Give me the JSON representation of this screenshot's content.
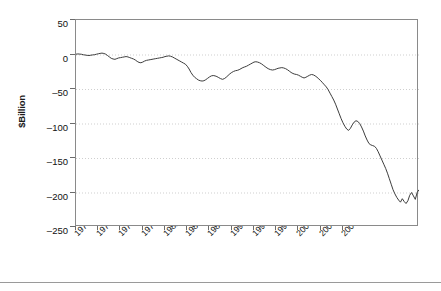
{
  "chart_data": {
    "type": "line",
    "title": "",
    "xlabel": "",
    "ylabel": "$Billion",
    "ylim": [
      -250,
      50
    ],
    "yticks": [
      50,
      0,
      -50,
      -100,
      -150,
      -200,
      -250
    ],
    "xticks": [
      "1970-Q1",
      "1973-Q1",
      "1976-Q1",
      "1979-Q1",
      "1982-Q1",
      "1985-Q1",
      "1988-Q1",
      "1991-Q1",
      "1994-Q1",
      "1997-Q1",
      "2000-Q1",
      "2003-Q1",
      "2006-Q1"
    ],
    "grid": "horizontal-dotted",
    "legend": "none",
    "series": [
      {
        "name": "Balance",
        "color": "#3d3d3d",
        "x_start": "1970-Q1",
        "x_end": "2007-Q3",
        "frequency": "quarterly",
        "values": [
          0.5,
          0.8,
          0.6,
          0.3,
          -0.4,
          -0.8,
          -1.2,
          -1.5,
          -1.0,
          -0.6,
          -0.3,
          0.4,
          1.0,
          1.6,
          2.0,
          1.5,
          0.5,
          -1.5,
          -3.5,
          -5.5,
          -6.5,
          -7.0,
          -6.0,
          -5.0,
          -4.5,
          -4.0,
          -3.5,
          -3.0,
          -3.5,
          -4.5,
          -5.5,
          -6.5,
          -8.0,
          -10.0,
          -11.5,
          -12.0,
          -11.0,
          -9.5,
          -8.5,
          -8.0,
          -7.5,
          -7.0,
          -6.5,
          -6.0,
          -5.5,
          -5.0,
          -4.5,
          -4.0,
          -3.0,
          -2.5,
          -2.0,
          -2.5,
          -3.5,
          -5.0,
          -6.5,
          -8.0,
          -9.5,
          -11.0,
          -12.5,
          -14.0,
          -17.0,
          -21.0,
          -26.0,
          -30.0,
          -33.0,
          -35.0,
          -37.0,
          -38.0,
          -38.5,
          -38.0,
          -36.5,
          -34.5,
          -32.5,
          -31.0,
          -30.5,
          -31.0,
          -32.0,
          -33.5,
          -35.0,
          -36.0,
          -35.0,
          -33.0,
          -30.5,
          -28.0,
          -26.0,
          -24.5,
          -23.5,
          -23.0,
          -22.0,
          -20.5,
          -19.0,
          -18.0,
          -17.0,
          -15.5,
          -14.0,
          -12.5,
          -11.0,
          -10.5,
          -11.0,
          -12.0,
          -13.5,
          -15.5,
          -17.5,
          -19.5,
          -21.0,
          -22.0,
          -22.5,
          -22.0,
          -21.0,
          -20.0,
          -19.5,
          -19.0,
          -19.5,
          -20.5,
          -22.0,
          -24.0,
          -26.0,
          -27.5,
          -28.5,
          -29.0,
          -30.0,
          -31.5,
          -33.0,
          -34.0,
          -33.0,
          -31.5,
          -30.0,
          -29.0,
          -29.5,
          -31.0,
          -33.0,
          -35.5,
          -38.0,
          -41.0,
          -44.0,
          -47.0,
          -51.0,
          -56.0,
          -61.0,
          -66.0,
          -72.0,
          -79.0,
          -86.0,
          -93.0,
          -99.0,
          -104.0,
          -108.0,
          -110.0,
          -107.0,
          -102.0,
          -98.0,
          -96.0,
          -97.0,
          -100.0,
          -105.0,
          -111.0,
          -118.0,
          -124.0,
          -129.0,
          -131.0,
          -132.0,
          -133.0,
          -136.0,
          -141.0,
          -147.0,
          -153.0,
          -159.0,
          -165.0,
          -172.0,
          -180.0,
          -188.0,
          -196.0,
          -202.0,
          -207.0,
          -211.0,
          -214.0,
          -209.0,
          -213.0,
          -216.0,
          -212.0,
          -204.0,
          -200.0,
          -205.0,
          -210.0,
          -200.0,
          -196.0
        ]
      }
    ]
  }
}
